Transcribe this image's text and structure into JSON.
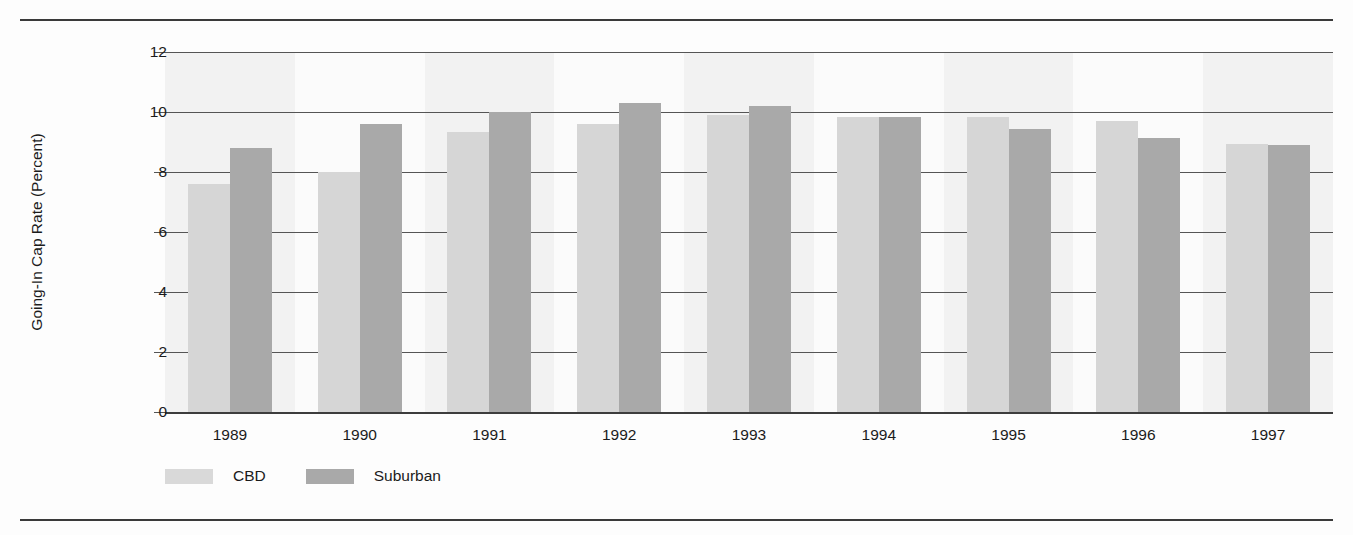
{
  "chart_data": {
    "type": "bar",
    "title": "",
    "xlabel": "",
    "ylabel": "Going-In Cap Rate (Percent)",
    "categories": [
      "1989",
      "1990",
      "1991",
      "1992",
      "1993",
      "1994",
      "1995",
      "1996",
      "1997"
    ],
    "series": [
      {
        "name": "CBD",
        "color": "#d6d6d6",
        "values": [
          7.6,
          8.0,
          9.35,
          9.6,
          9.9,
          9.85,
          9.85,
          9.7,
          8.95
        ]
      },
      {
        "name": "Suburban",
        "color": "#a9a9a9",
        "values": [
          8.8,
          9.6,
          10.0,
          10.3,
          10.2,
          9.85,
          9.45,
          9.15,
          8.9
        ]
      }
    ],
    "yticks": [
      0,
      2,
      4,
      6,
      8,
      10,
      12
    ],
    "ytick_labels": [
      "0",
      "2",
      "4",
      "6",
      "8",
      "10",
      "12"
    ],
    "ylim": [
      0,
      12
    ],
    "grid": true,
    "legend_position": "bottom-left",
    "legend_entries": [
      "CBD",
      "Suburban"
    ]
  },
  "figure": {
    "top_rule_color": "#3a3a3a",
    "bottom_rule_color": "#3a3a3a",
    "background": "#fdfdfd",
    "plot_background": "#fbfbfb",
    "band_color": "#f2f2f2",
    "gridline_color": "#555555"
  }
}
